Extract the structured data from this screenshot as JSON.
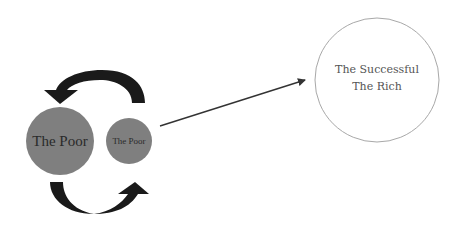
{
  "diagram": {
    "nodes": [
      {
        "id": "poor-large",
        "label": "The Poor",
        "fill": "#7f7f7f",
        "text_color": "#2a2a2a"
      },
      {
        "id": "poor-small",
        "label": "The Poor",
        "fill": "#7f7f7f",
        "text_color": "#2a2a2a"
      },
      {
        "id": "successful-rich",
        "label_line1": "The Successful",
        "label_line2": "The Rich",
        "fill": "#ffffff",
        "stroke": "#a8a8a8",
        "text_color": "#555555"
      }
    ],
    "edges": [
      {
        "from": "poor-small",
        "to": "poor-large",
        "type": "curved-arrow",
        "direction": "top, right-to-left"
      },
      {
        "from": "poor-large",
        "to": "poor-small",
        "type": "curved-arrow",
        "direction": "bottom, left-to-right"
      },
      {
        "from": "poor-small",
        "to": "successful-rich",
        "type": "straight-arrow"
      }
    ],
    "colors": {
      "arrow_dark": "#1a1a1a",
      "connector": "#333333"
    }
  }
}
